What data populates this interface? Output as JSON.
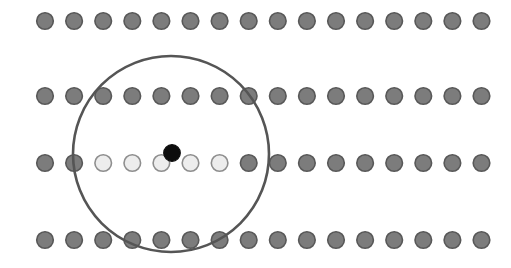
{
  "figure": {
    "canvas": {
      "width": 511,
      "height": 268,
      "background": "#ffffff"
    }
  },
  "chart_data": {
    "type": "scatter",
    "subtitle": "",
    "xlabel": "",
    "ylabel": "",
    "xlim": [
      0,
      511
    ],
    "ylim": [
      0,
      268
    ],
    "grid": false,
    "legend": null,
    "axes_visible": false,
    "tick_labels_x": [],
    "tick_labels_y": [],
    "annotations": [],
    "lattice": {
      "rows": 4,
      "columns": 16,
      "x_start": 45,
      "x_spacing": 29.1,
      "row_y": [
        21,
        96,
        163,
        240
      ],
      "dot_radius": 8.3,
      "dot_ring_width": 1.6
    },
    "colors": {
      "dot_fill_gray": "#7c7c7c",
      "dot_ring_gray": "#585858",
      "dot_fill_light": "#ededed",
      "dot_ring_light": "#8e8e8e",
      "dot_fill_black": "#0d0d0d",
      "dot_ring_black": "#0d0d0d",
      "circle_stroke": "#555555",
      "background": "#ffffff"
    },
    "series": [
      {
        "name": "lattice-row-1",
        "row_index": 0,
        "y": 21,
        "x": [
          45,
          74.1,
          103.2,
          132.3,
          161.4,
          190.5,
          219.6,
          248.7,
          277.8,
          306.9,
          336.0,
          365.1,
          394.2,
          423.3,
          452.4,
          481.5
        ],
        "states": [
          "gray",
          "gray",
          "gray",
          "gray",
          "gray",
          "gray",
          "gray",
          "gray",
          "gray",
          "gray",
          "gray",
          "gray",
          "gray",
          "gray",
          "gray",
          "gray"
        ]
      },
      {
        "name": "lattice-row-2",
        "row_index": 1,
        "y": 96,
        "x": [
          45,
          74.1,
          103.2,
          132.3,
          161.4,
          190.5,
          219.6,
          248.7,
          277.8,
          306.9,
          336.0,
          365.1,
          394.2,
          423.3,
          452.4,
          481.5
        ],
        "states": [
          "gray",
          "gray",
          "gray",
          "gray",
          "gray",
          "gray",
          "gray",
          "gray",
          "gray",
          "gray",
          "gray",
          "gray",
          "gray",
          "gray",
          "gray",
          "gray"
        ]
      },
      {
        "name": "lattice-row-3",
        "row_index": 2,
        "y": 163,
        "x": [
          45,
          74.1,
          103.2,
          132.3,
          161.4,
          190.5,
          219.6,
          248.7,
          277.8,
          306.9,
          336.0,
          365.1,
          394.2,
          423.3,
          452.4,
          481.5
        ],
        "states": [
          "gray",
          "gray",
          "light",
          "light",
          "light",
          "light",
          "light",
          "gray",
          "gray",
          "gray",
          "gray",
          "gray",
          "gray",
          "gray",
          "gray",
          "gray"
        ]
      },
      {
        "name": "lattice-row-4",
        "row_index": 3,
        "y": 240,
        "x": [
          45,
          74.1,
          103.2,
          132.3,
          161.4,
          190.5,
          219.6,
          248.7,
          277.8,
          306.9,
          336.0,
          365.1,
          394.2,
          423.3,
          452.4,
          481.5
        ],
        "states": [
          "gray",
          "gray",
          "gray",
          "gray",
          "gray",
          "gray",
          "gray",
          "gray",
          "gray",
          "gray",
          "gray",
          "gray",
          "gray",
          "gray",
          "gray",
          "gray"
        ]
      }
    ],
    "marked_point": {
      "name": "center-black-dot",
      "x": 172,
      "y": 153,
      "radius": 8.3,
      "state": "black"
    },
    "overlay_circle": {
      "name": "neighborhood-circle",
      "cx": 171,
      "cy": 154,
      "r": 98,
      "stroke_width": 2.6,
      "fill": "none"
    }
  }
}
